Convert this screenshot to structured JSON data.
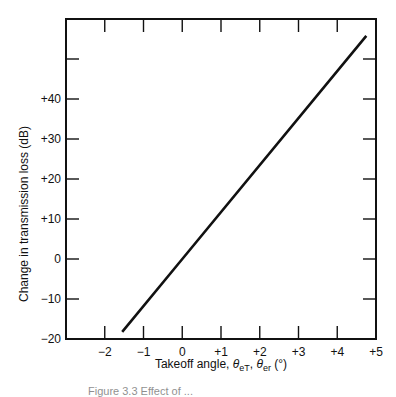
{
  "chart_data": {
    "type": "line",
    "title": "",
    "xlabel": "Takeoff angle, θeT, θer (°)",
    "ylabel": "Change in transmission loss (dB)",
    "xlim": [
      -3,
      5
    ],
    "ylim": [
      -20,
      60
    ],
    "x_ticks": [
      -2,
      -1,
      0,
      1,
      2,
      3,
      4,
      5
    ],
    "x_tick_labels": [
      "−2",
      "−1",
      "0",
      "+1",
      "+2",
      "+3",
      "+4",
      "+5"
    ],
    "y_ticks": [
      -20,
      -10,
      0,
      10,
      20,
      30,
      40,
      50
    ],
    "y_tick_labels": [
      "−20",
      "−10",
      "0",
      "+10",
      "+20",
      "+30",
      "+40",
      ""
    ],
    "grid": false,
    "legend": null,
    "series": [
      {
        "name": "Change in transmission loss",
        "x": [
          -1.55,
          0,
          4.75
        ],
        "y": [
          -18.2,
          0,
          55.8
        ]
      }
    ]
  },
  "caption": "Figure 3.3  Effect of ..."
}
